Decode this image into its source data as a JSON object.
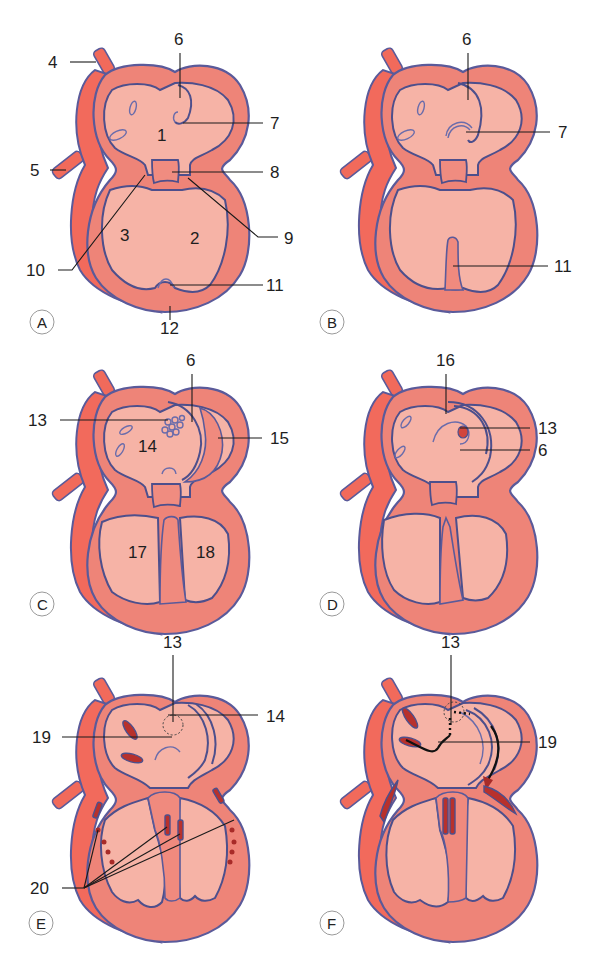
{
  "figure": {
    "panels": [
      {
        "id": "A",
        "letter": "A",
        "labels": [
          "4",
          "5",
          "6",
          "7",
          "8",
          "9",
          "10",
          "11",
          "12"
        ],
        "chamber_labels": [
          "1",
          "2",
          "3"
        ]
      },
      {
        "id": "B",
        "letter": "B",
        "labels": [
          "6",
          "7",
          "11"
        ],
        "chamber_labels": []
      },
      {
        "id": "C",
        "letter": "C",
        "labels": [
          "6",
          "13",
          "15"
        ],
        "chamber_labels": [
          "14",
          "17",
          "18"
        ]
      },
      {
        "id": "D",
        "letter": "D",
        "labels": [
          "16",
          "13",
          "6"
        ],
        "chamber_labels": []
      },
      {
        "id": "E",
        "letter": "E",
        "labels": [
          "13",
          "14",
          "19",
          "20"
        ],
        "chamber_labels": []
      },
      {
        "id": "F",
        "letter": "F",
        "labels": [
          "13",
          "19"
        ],
        "chamber_labels": []
      }
    ]
  },
  "colors": {
    "myocardium": "#ee8478",
    "cavity": "#f6b3a6",
    "outline": "#4d4f8c",
    "vessel": "#f16a5b",
    "valve_tissue": "#b8312c"
  }
}
